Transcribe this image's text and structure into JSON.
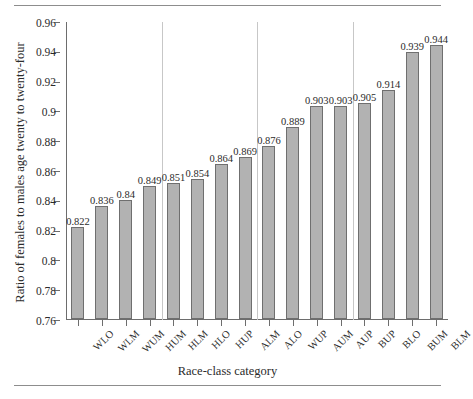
{
  "chart_data": {
    "type": "bar",
    "title": "",
    "xlabel": "Race-class category",
    "ylabel": "Ratio of females to males age twenty to twenty-four",
    "ylim": [
      0.76,
      0.96
    ],
    "ytick_labels": [
      "0.96",
      "0.94",
      "0.92",
      "0.9",
      "0.88",
      "0.86",
      "0.84",
      "0.82",
      "0.8",
      "0.78",
      "0.76"
    ],
    "ytick_values": [
      0.96,
      0.94,
      0.92,
      0.9,
      0.88,
      0.86,
      0.84,
      0.82,
      0.8,
      0.78,
      0.76
    ],
    "grid": false,
    "legend": "none",
    "categories": [
      "WLO",
      "WLM",
      "WUM",
      "HUM",
      "HLM",
      "HLO",
      "HUP",
      "ALM",
      "ALO",
      "WUP",
      "AUM",
      "AUP",
      "BUP",
      "BLO",
      "BUM",
      "BLM"
    ],
    "values": [
      0.822,
      0.836,
      0.84,
      0.849,
      0.851,
      0.854,
      0.864,
      0.869,
      0.876,
      0.889,
      0.903,
      0.903,
      0.905,
      0.914,
      0.939,
      0.944
    ],
    "value_labels": [
      "0.822",
      "0.836",
      "0.84",
      "0.849",
      "0.851",
      "0.854",
      "0.864",
      "0.869",
      "0.876",
      "0.889",
      "0.903",
      "0.903",
      "0.905",
      "0.914",
      "0.939",
      "0.944"
    ],
    "group_separators_after_index": [
      3,
      7,
      11
    ],
    "bar_fill_color": "#b2b2b2",
    "bar_edge_color": "#6f6f6f",
    "separator_color": "#c7c7c7",
    "axis_color": "#6d6d6d",
    "text_color": "#2b2b2b",
    "background_color": "#ffffff"
  }
}
